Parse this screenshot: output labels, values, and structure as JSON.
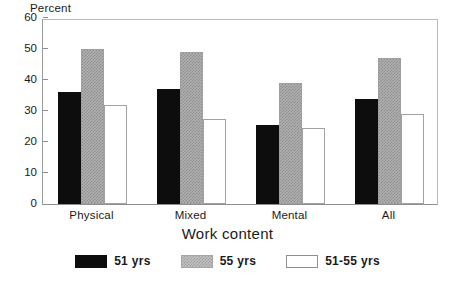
{
  "chart_data": {
    "type": "bar",
    "title": "",
    "ylabel": "Percent",
    "xlabel": "Work content",
    "categories": [
      "Physical",
      "Mixed",
      "Mental",
      "All"
    ],
    "series": [
      {
        "name": "51 yrs",
        "color": "#0d0d0d",
        "values": [
          36,
          37,
          25.5,
          34
        ]
      },
      {
        "name": "55 yrs",
        "color": "#a8a8a8",
        "values": [
          50,
          49,
          39,
          47
        ]
      },
      {
        "name": "51-55 yrs",
        "color": "#ffffff",
        "values": [
          32,
          27.5,
          24.5,
          29
        ]
      }
    ],
    "ylim": [
      0,
      60
    ],
    "yticks": [
      0,
      10,
      20,
      30,
      40,
      50,
      60
    ],
    "ytick_labels": [
      "0",
      "10",
      "20",
      "30",
      "40",
      "50",
      "60"
    ],
    "grid": false,
    "legend_position": "bottom-center"
  }
}
